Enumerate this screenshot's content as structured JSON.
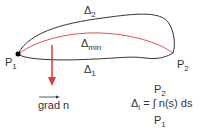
{
  "diagram": {
    "type": "fermat-principle-paths",
    "points": {
      "p1": {
        "label": "P",
        "sub": "1"
      },
      "p2": {
        "label": "P",
        "sub": "2"
      }
    },
    "paths": {
      "delta2": {
        "label": "Δ",
        "sub": "2",
        "color": "#333333"
      },
      "delta_min": {
        "label": "Δ",
        "sub": "min",
        "color": "#e05050"
      },
      "delta1": {
        "label": "Δ",
        "sub": "1",
        "color": "#333333"
      }
    },
    "gradient": {
      "label": "grad n",
      "color": "#e03a3a"
    },
    "formula": {
      "lhs": "Δ",
      "lhs_sub": "i",
      "equals": " = ",
      "integral": "∫",
      "integrand": " n(s) ds",
      "upper": "P",
      "upper_sub": "2",
      "lower": "P",
      "lower_sub": "1"
    }
  }
}
